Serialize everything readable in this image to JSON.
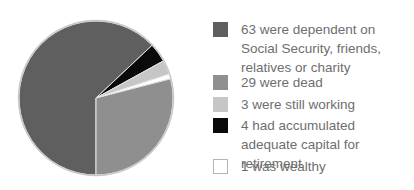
{
  "chart_data": {
    "type": "pie",
    "title": "",
    "total": 100,
    "slices": [
      {
        "label": "63 were dependent on Social Security, friends, relatives or charity",
        "value": 63,
        "color": "#5f5f5f"
      },
      {
        "label": "29 were dead",
        "value": 29,
        "color": "#8f8f8f"
      },
      {
        "label": "3 were still working",
        "value": 3,
        "color": "#c6c6c6"
      },
      {
        "label": "4 had accumulated adequate capital for retirement",
        "value": 4,
        "color": "#0a0a0a"
      },
      {
        "label": "1 was wealthy",
        "value": 1,
        "color": "#ffffff"
      }
    ],
    "legend_position": "right"
  },
  "legend": {
    "items": [
      {
        "text": "63 were dependent on Social Security, friends, relatives or charity",
        "color": "#5f5f5f",
        "border": "#5f5f5f",
        "top": 22
      },
      {
        "text": "29 were dead",
        "color": "#8f8f8f",
        "border": "#8f8f8f",
        "top": 75
      },
      {
        "text": "3 were still working",
        "color": "#c6c6c6",
        "border": "#c6c6c6",
        "top": 97
      },
      {
        "text": "4 had accumulated adequate capital for retirement",
        "color": "#0a0a0a",
        "border": "#0a0a0a",
        "top": 118
      },
      {
        "text": "1 was wealthy",
        "color": "#ffffff",
        "border": "#b5b5b5",
        "top": 159
      }
    ]
  }
}
